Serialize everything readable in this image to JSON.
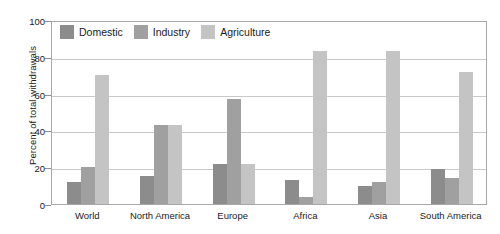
{
  "chart_data": {
    "type": "bar",
    "title": "",
    "subtitle": "",
    "xlabel": "",
    "ylabel": "Percent of total withdrawals",
    "ylim": [
      0,
      100
    ],
    "yticks": [
      0,
      20,
      40,
      60,
      80,
      100
    ],
    "grid": true,
    "legend_position": "top-left-inside",
    "categories": [
      "World",
      "North America",
      "Europe",
      "Africa",
      "Asia",
      "South America"
    ],
    "series": [
      {
        "name": "Domestic",
        "color": "#8c8c8c",
        "values": [
          12,
          15,
          22,
          13,
          10,
          19
        ]
      },
      {
        "name": "Industry",
        "color": "#a0a0a0",
        "values": [
          20,
          43,
          57,
          4,
          12,
          14
        ]
      },
      {
        "name": "Agriculture",
        "color": "#c4c4c4",
        "values": [
          70,
          43,
          22,
          83,
          83,
          72
        ]
      }
    ]
  },
  "colors": {
    "domestic": "#8c8c8c",
    "industry": "#a0a0a0",
    "agriculture": "#c4c4c4",
    "gridline": "#c9c9c9",
    "frame": "#a8a8a8",
    "text": "#1b1b1b",
    "background": "#ffffff"
  }
}
